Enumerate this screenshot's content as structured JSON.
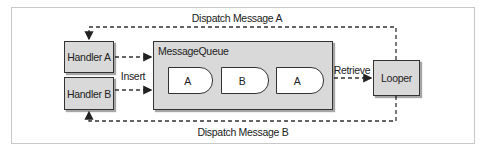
{
  "diagram": {
    "title": "",
    "nodes": {
      "handler_a": "Handler A",
      "handler_b": "Handler B",
      "message_queue": "MessageQueue",
      "looper": "Looper"
    },
    "queue_tokens": [
      "A",
      "B",
      "A"
    ],
    "edges": {
      "insert": "Insert",
      "retrieve": "Retrieve",
      "dispatch_a": "Dispatch Message A",
      "dispatch_b": "Dispatch Message B"
    },
    "colors": {
      "box_fill": "#d9d9d9",
      "token_fill": "#ffffff",
      "stroke": "#333333",
      "frame": "#c8c8c8"
    }
  }
}
